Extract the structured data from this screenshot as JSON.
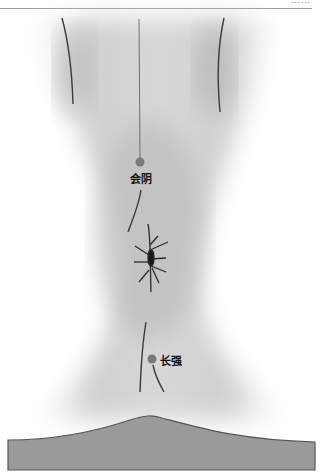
{
  "figure": {
    "type": "anatomical-illustration",
    "points": [
      {
        "name": "会阴",
        "x": 140,
        "y": 162,
        "label_x": 130,
        "label_y": 170
      },
      {
        "name": "长强",
        "x": 152,
        "y": 359,
        "label_x": 160,
        "label_y": 352
      }
    ],
    "colors": {
      "skin_shadow": "#8f8f8f",
      "line": "#3a3a3a",
      "point": "#7a7a7a",
      "base": "#9a9a9a",
      "base_outline": "#555555"
    }
  },
  "header": {
    "text": "……"
  }
}
